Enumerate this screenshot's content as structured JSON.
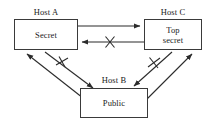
{
  "diagram": {
    "line_color": "#2b2b2b",
    "box_border_color": "#3a3a3a",
    "background": "#ffffff",
    "nodes": [
      {
        "id": "host-a",
        "host_label": "Host A",
        "classification": "Secret"
      },
      {
        "id": "host-c",
        "host_label": "Host C",
        "classification": "Top\nsecret"
      },
      {
        "id": "host-b",
        "host_label": "Host B",
        "classification": "Public"
      }
    ],
    "flows": [
      {
        "id": "a-to-c",
        "from": "Host A",
        "to": "Host C",
        "blocked": false,
        "marker": ""
      },
      {
        "id": "c-to-a",
        "from": "Host C",
        "to": "Host A",
        "blocked": true,
        "marker": "X"
      },
      {
        "id": "b-to-a",
        "from": "Host B",
        "to": "Host A",
        "blocked": false,
        "marker": ""
      },
      {
        "id": "a-to-b",
        "from": "Host A",
        "to": "Host B",
        "blocked": true,
        "marker": "X"
      },
      {
        "id": "c-to-b",
        "from": "Host C",
        "to": "Host B",
        "blocked": true,
        "marker": "X"
      },
      {
        "id": "b-to-c",
        "from": "Host B",
        "to": "Host C",
        "blocked": false,
        "marker": ""
      }
    ]
  }
}
